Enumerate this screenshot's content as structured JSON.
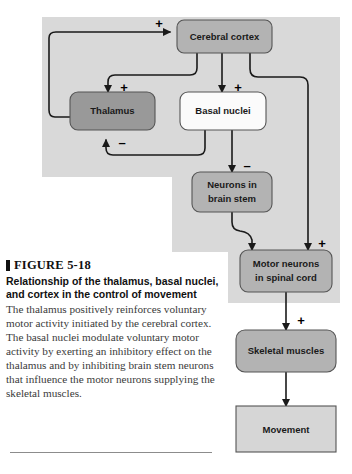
{
  "figure": {
    "marker_icon": "figure-square-marker",
    "number_label": "FIGURE 5-18",
    "title": "Relationship of the thalamus, basal nuclei, and cortex in the control of movement",
    "body": "The thalamus positively reinforces voluntary motor activity initiated by the cerebral cortex. The basal nuclei modulate voluntary motor activity by exerting an inhibitory effect on the thalamus and by inhibiting brain stem neurons that influence the motor neurons supplying the skeletal muscles."
  },
  "diagram": {
    "type": "flowchart",
    "panel_fill": "#d9d9d9",
    "nodes": [
      {
        "id": "cerebral-cortex",
        "label": "Cerebral cortex",
        "fill": "#b3b3b3",
        "shape": "rounded"
      },
      {
        "id": "thalamus",
        "label": "Thalamus",
        "fill": "#999999",
        "shape": "rounded"
      },
      {
        "id": "basal-nuclei",
        "label": "Basal nuclei",
        "fill": "#fbfbfb",
        "shape": "rounded"
      },
      {
        "id": "neurons-in-brain-stem",
        "label": "Neurons in brain stem",
        "line1": "Neurons in",
        "line2": "brain stem",
        "fill": "#b3b3b3",
        "shape": "rounded"
      },
      {
        "id": "motor-neurons-in-spinal-cord",
        "label": "Motor neurons in spinal cord",
        "line1": "Motor neurons",
        "line2": "in spinal cord",
        "fill": "#b3b3b3",
        "shape": "rounded"
      },
      {
        "id": "skeletal-muscles",
        "label": "Skeletal muscles",
        "fill": "#b3b3b3",
        "shape": "rounded"
      },
      {
        "id": "movement",
        "label": "Movement",
        "fill": "#d6d6d6",
        "shape": "square"
      }
    ],
    "edges": [
      {
        "id": "thalamus-to-cortex",
        "from": "thalamus",
        "to": "cerebral-cortex",
        "sign": "+"
      },
      {
        "id": "cortex-to-thalamus",
        "from": "cerebral-cortex",
        "to": "thalamus",
        "sign": "+"
      },
      {
        "id": "cortex-to-basal-nuclei",
        "from": "cerebral-cortex",
        "to": "basal-nuclei",
        "sign": "+"
      },
      {
        "id": "basal-nuclei-to-thalamus",
        "from": "basal-nuclei",
        "to": "thalamus",
        "sign": "–"
      },
      {
        "id": "basal-nuclei-to-brain-stem",
        "from": "basal-nuclei",
        "to": "neurons-in-brain-stem",
        "sign": "–"
      },
      {
        "id": "brain-stem-to-motor-neurons",
        "from": "neurons-in-brain-stem",
        "to": "motor-neurons-in-spinal-cord",
        "sign": ""
      },
      {
        "id": "cortex-to-motor-neurons",
        "from": "cerebral-cortex",
        "to": "motor-neurons-in-spinal-cord",
        "sign": "+"
      },
      {
        "id": "motor-neurons-to-skeletal-muscles",
        "from": "motor-neurons-in-spinal-cord",
        "to": "skeletal-muscles",
        "sign": "+"
      },
      {
        "id": "skeletal-muscles-to-movement",
        "from": "skeletal-muscles",
        "to": "movement",
        "sign": ""
      }
    ],
    "signs": {
      "plus": "+",
      "minus": "–"
    }
  }
}
